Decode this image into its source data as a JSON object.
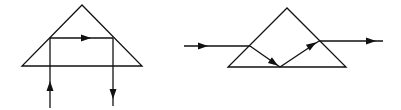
{
  "diagrams": [
    {
      "name": "right-angle-prism-retroreflection",
      "prism": {
        "apex": [
          82,
          5
        ],
        "base_left": [
          22,
          66
        ],
        "base_right": [
          142,
          66
        ]
      },
      "rays": [
        {
          "name": "incident-ray",
          "points": [
            [
              50,
              108
            ],
            [
              50,
              38
            ]
          ],
          "arrow_at": [
            50,
            86
          ],
          "direction": "up"
        },
        {
          "name": "internal-ray",
          "points": [
            [
              50,
              38
            ],
            [
              113,
              38
            ]
          ],
          "arrow_at": [
            86,
            38
          ],
          "direction": "right"
        },
        {
          "name": "exit-ray",
          "points": [
            [
              113,
              38
            ],
            [
              113,
              106
            ]
          ],
          "arrow_at": [
            113,
            94
          ],
          "direction": "down"
        }
      ]
    },
    {
      "name": "dove-prism-path",
      "prism": {
        "apex": [
          287,
          8
        ],
        "base_left": [
          228,
          67
        ],
        "base_right": [
          346,
          67
        ]
      },
      "rays": [
        {
          "name": "incident-ray",
          "points": [
            [
              184,
              46
            ],
            [
              250,
              46
            ]
          ],
          "arrow_at": [
            203,
            46
          ],
          "direction": "right"
        },
        {
          "name": "refracted-ray-down",
          "points": [
            [
              250,
              46
            ],
            [
              280,
              67
            ]
          ],
          "arrow_at": [
            274,
            63
          ],
          "direction": "down-right"
        },
        {
          "name": "reflected-ray-up",
          "points": [
            [
              280,
              67
            ],
            [
              319,
              41
            ]
          ],
          "arrow_at": [
            312,
            45
          ],
          "direction": "up-right"
        },
        {
          "name": "exit-ray",
          "points": [
            [
              319,
              41
            ],
            [
              383,
              41
            ]
          ],
          "arrow_at": [
            371,
            41
          ],
          "direction": "right"
        }
      ]
    }
  ],
  "colors": {
    "line": "#111111",
    "background": "#ffffff"
  }
}
